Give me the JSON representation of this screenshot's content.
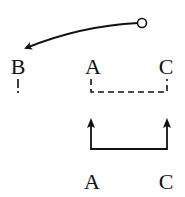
{
  "diagram": {
    "top_labels": [
      {
        "id": "B",
        "text": "B",
        "x": 18,
        "y": 74
      },
      {
        "id": "A",
        "text": "A",
        "x": 93,
        "y": 74
      },
      {
        "id": "C",
        "text": "C",
        "x": 166,
        "y": 74
      }
    ],
    "bottom_labels": [
      {
        "id": "A",
        "text": "A",
        "x": 92,
        "y": 189
      },
      {
        "id": "C",
        "text": "C",
        "x": 166,
        "y": 189
      }
    ],
    "colors": {
      "ink": "#111111",
      "background": "#ffffff"
    },
    "elements": {
      "curved_arrow": {
        "from": "circle (142,23)",
        "to": "B",
        "description": "curved arrow from open circle to B"
      },
      "dashed_bracket": {
        "connects": [
          "A",
          "C"
        ],
        "style": "dashed"
      },
      "solid_bracket": {
        "connects": [
          "A",
          "C"
        ],
        "style": "solid",
        "arrowheads": "up"
      }
    }
  }
}
